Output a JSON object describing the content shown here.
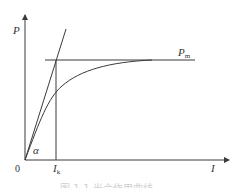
{
  "diagram": {
    "y_axis_label": "P",
    "x_axis_label": "I",
    "origin_label": "0",
    "saturation_label_main": "P",
    "saturation_label_sub": "m",
    "ik_label_main": "I",
    "ik_label_sub": "k",
    "angle_label": "α",
    "caption": "图 1-1  光合作用曲线"
  },
  "colors": {
    "line": "#3a3a3a",
    "text": "#333333",
    "caption": "#d0d0d0"
  }
}
